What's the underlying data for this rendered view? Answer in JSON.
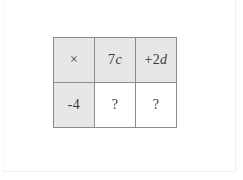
{
  "worksheet": {
    "grid": {
      "operator_symbol": "×",
      "column_headers": [
        {
          "coefficient": "7",
          "variable": "c",
          "display": "7c"
        },
        {
          "coefficient": "+2",
          "variable": "d",
          "display": "+2d"
        }
      ],
      "row_headers": [
        {
          "display": "-4"
        }
      ],
      "cells": [
        {
          "display": "?",
          "row": "-4",
          "column": "7c"
        },
        {
          "display": "?",
          "row": "-4",
          "column": "+2d"
        }
      ]
    },
    "colors": {
      "header_fill": "#e7e7e7",
      "cell_fill": "#ffffff",
      "border": "#8c8c8c",
      "text": "#3b3b3b",
      "page_background": "#ffffff"
    }
  }
}
